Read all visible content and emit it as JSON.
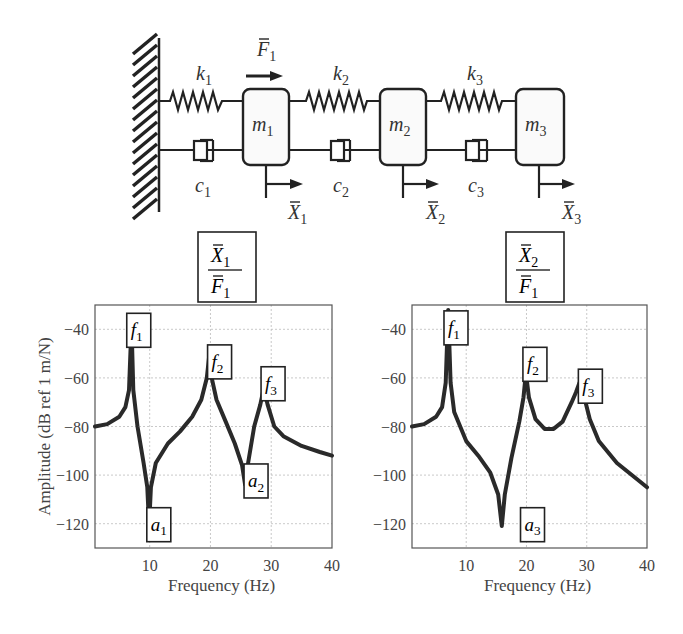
{
  "diagram": {
    "masses": [
      {
        "label": "m",
        "sub": "1"
      },
      {
        "label": "m",
        "sub": "2"
      },
      {
        "label": "m",
        "sub": "3"
      }
    ],
    "springs": [
      {
        "label": "k",
        "sub": "1"
      },
      {
        "label": "k",
        "sub": "2"
      },
      {
        "label": "k",
        "sub": "3"
      }
    ],
    "dampers": [
      {
        "label": "c",
        "sub": "1"
      },
      {
        "label": "c",
        "sub": "2"
      },
      {
        "label": "c",
        "sub": "3"
      }
    ],
    "displacements": [
      {
        "label": "X",
        "sub": "1"
      },
      {
        "label": "X",
        "sub": "2"
      },
      {
        "label": "X",
        "sub": "3"
      }
    ],
    "force": {
      "label": "F",
      "sub": "1"
    }
  },
  "chart_data": [
    {
      "type": "line",
      "title": "X1 / F1",
      "title_num": {
        "label": "X",
        "sub": "1"
      },
      "title_den": {
        "label": "F",
        "sub": "1"
      },
      "xlabel": "Frequency (Hz)",
      "ylabel": "Amplitude (dB ref 1 m/N)",
      "xlim": [
        1,
        40
      ],
      "ylim": [
        -130,
        -30
      ],
      "xticks": [
        10,
        20,
        30,
        40
      ],
      "yticks": [
        -40,
        -60,
        -80,
        -100,
        -120
      ],
      "grid": true,
      "x": [
        1,
        3,
        5,
        6,
        6.6,
        7,
        7.3,
        8,
        9,
        9.6,
        9.9,
        10.2,
        11,
        13,
        15,
        17,
        18.5,
        19.4,
        19.8,
        20.2,
        21,
        22.5,
        24,
        25.2,
        25.7,
        26.2,
        27.2,
        28.2,
        28.8,
        29.4,
        30.5,
        32,
        35,
        38,
        40
      ],
      "y": [
        -80,
        -79,
        -76,
        -72,
        -65,
        -38,
        -65,
        -80,
        -95,
        -105,
        -121,
        -105,
        -95,
        -87,
        -82,
        -76,
        -69,
        -60,
        -51,
        -60,
        -69,
        -78,
        -87,
        -96,
        -104,
        -95,
        -80,
        -71,
        -64,
        -71,
        -80,
        -84,
        -88,
        -90.5,
        -92
      ],
      "annotations": [
        {
          "label": "f",
          "sub": "1",
          "x": 8.2,
          "y": -40
        },
        {
          "label": "f",
          "sub": "2",
          "x": 21.5,
          "y": -53
        },
        {
          "label": "f",
          "sub": "3",
          "x": 30.3,
          "y": -62
        },
        {
          "label": "a",
          "sub": "1",
          "x": 11.5,
          "y": -120
        },
        {
          "label": "a",
          "sub": "2",
          "x": 27.5,
          "y": -102
        }
      ]
    },
    {
      "type": "line",
      "title": "X2 / F1",
      "title_num": {
        "label": "X",
        "sub": "2"
      },
      "title_den": {
        "label": "F",
        "sub": "1"
      },
      "xlabel": "Frequency (Hz)",
      "ylabel": "",
      "xlim": [
        1,
        40
      ],
      "ylim": [
        -130,
        -30
      ],
      "xticks": [
        10,
        20,
        30,
        40
      ],
      "yticks": [
        -40,
        -60,
        -80,
        -100,
        -120
      ],
      "grid": true,
      "x": [
        1,
        3,
        5,
        6,
        6.6,
        7,
        7.4,
        8,
        10,
        12,
        14,
        15.3,
        15.9,
        16.4,
        17.5,
        18.8,
        19.5,
        19.9,
        20.4,
        21.5,
        23,
        24.5,
        26,
        27.5,
        28.2,
        28.8,
        29.4,
        30.5,
        32,
        35,
        38,
        40
      ],
      "y": [
        -80,
        -79,
        -76,
        -72,
        -62,
        -32,
        -62,
        -74,
        -86,
        -92,
        -99,
        -108,
        -121,
        -108,
        -93,
        -78,
        -68,
        -58,
        -68,
        -77,
        -81,
        -81,
        -78,
        -70,
        -66,
        -62,
        -66,
        -77,
        -86,
        -95,
        -101,
        -105
      ],
      "annotations": [
        {
          "label": "f",
          "sub": "1",
          "x": 8.3,
          "y": -39
        },
        {
          "label": "f",
          "sub": "2",
          "x": 21.4,
          "y": -54
        },
        {
          "label": "f",
          "sub": "3",
          "x": 30.6,
          "y": -63
        },
        {
          "label": "a",
          "sub": "3",
          "x": 21.0,
          "y": -120
        }
      ]
    }
  ]
}
